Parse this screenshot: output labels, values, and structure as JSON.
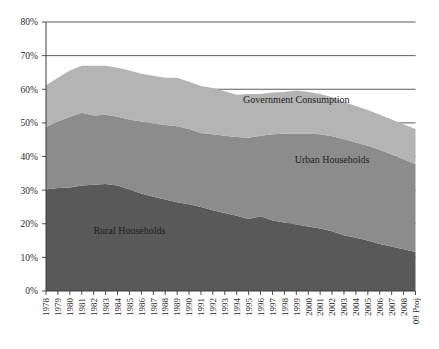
{
  "chart_data": {
    "type": "area",
    "title": "",
    "subtitle": "",
    "xlabel": "",
    "ylabel": "",
    "stacked": true,
    "grid": true,
    "legend_position": "inline-annotations",
    "ylim": [
      0,
      80
    ],
    "ytick_values": [
      0,
      10,
      20,
      30,
      40,
      50,
      60,
      70,
      80
    ],
    "ytick_labels": [
      "0%",
      "10%",
      "20%",
      "30%",
      "40%",
      "50%",
      "60%",
      "70%",
      "80%"
    ],
    "categories": [
      "1978",
      "1979",
      "1980",
      "1981",
      "1982",
      "1983",
      "1984",
      "1985",
      "1986",
      "1987",
      "1988",
      "1989",
      "1990",
      "1991",
      "1992",
      "1993",
      "1994",
      "1995",
      "1996",
      "1997",
      "1998",
      "1999",
      "2000",
      "2001",
      "2002",
      "2003",
      "2004",
      "2005",
      "2006",
      "2007",
      "2008",
      "09 Proj"
    ],
    "series": [
      {
        "name": "Rural Households",
        "color": "#595959",
        "values": [
          30.2,
          30.6,
          30.8,
          31.4,
          31.6,
          31.8,
          31.4,
          30.2,
          29.0,
          28.0,
          27.2,
          26.4,
          25.8,
          25.0,
          24.0,
          23.2,
          22.4,
          21.4,
          22.2,
          21.0,
          20.4,
          19.8,
          19.2,
          18.6,
          17.8,
          16.6,
          15.8,
          15.0,
          14.0,
          13.2,
          12.4,
          11.6
        ]
      },
      {
        "name": "Urban Households",
        "color": "#8c8c8c",
        "values": [
          18.6,
          19.8,
          21.0,
          21.6,
          20.6,
          20.6,
          20.4,
          20.8,
          21.4,
          21.8,
          22.2,
          22.6,
          22.4,
          22.0,
          22.6,
          23.0,
          23.4,
          24.2,
          24.0,
          25.6,
          26.4,
          27.0,
          27.6,
          28.0,
          28.2,
          28.6,
          28.4,
          28.2,
          28.0,
          27.4,
          26.8,
          26.2
        ]
      },
      {
        "name": "Government Consumption",
        "color": "#b4b4b4",
        "values": [
          12.4,
          13.0,
          13.8,
          14.0,
          14.8,
          14.6,
          14.6,
          14.6,
          14.2,
          14.2,
          14.0,
          14.4,
          14.0,
          14.0,
          13.8,
          13.2,
          12.6,
          13.0,
          12.4,
          12.4,
          12.4,
          12.8,
          12.4,
          12.0,
          11.6,
          11.0,
          10.8,
          10.6,
          10.4,
          10.4,
          10.4,
          10.4
        ]
      }
    ],
    "annotations": [
      {
        "text": "Government Consumption",
        "x_index": 21,
        "y_value": 56.0
      },
      {
        "text": "Urban Households",
        "x_index": 24,
        "y_value": 38.0
      },
      {
        "text": "Rural Households",
        "x_index": 7,
        "y_value": 17.0
      }
    ]
  },
  "colors": {
    "background": "#ffffff",
    "axis": "#3a3a3a",
    "grid": "#4a4a4a",
    "rural": "#595959",
    "urban": "#8c8c8c",
    "government": "#b4b4b4"
  }
}
